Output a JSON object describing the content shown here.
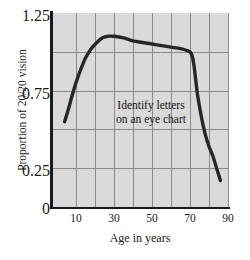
{
  "chart_data": {
    "type": "line",
    "title": "",
    "xlabel": "Age in years",
    "ylabel": "Proportion of 20/20 vision",
    "xlim": [
      3,
      90
    ],
    "ylim": [
      0,
      1.25
    ],
    "xticks": [
      10,
      30,
      50,
      70,
      90
    ],
    "xtick_labels": [
      "10",
      "30",
      "50",
      "70",
      "90"
    ],
    "yticks": [
      0,
      0.25,
      0.75,
      1.25
    ],
    "ytick_labels": [
      "0",
      "0.25",
      "0.75",
      "1.25"
    ],
    "grid": "both",
    "grid_x": [
      10,
      20,
      30,
      40,
      50,
      60,
      70,
      80,
      90
    ],
    "grid_y": [
      0.25,
      0.5,
      0.75,
      1.0
    ],
    "legend": "none",
    "annotations": [
      {
        "text_line_1": "Identify letters",
        "text_line_2": "on an eye chart",
        "x": 47,
        "y": 0.68
      }
    ],
    "series": [
      {
        "name": "Proportion of 20/20 vision",
        "color": "#262626",
        "x": [
          4,
          6,
          8,
          10,
          12,
          15,
          18,
          21,
          24,
          27,
          30,
          35,
          40,
          45,
          50,
          55,
          60,
          65,
          68,
          70,
          71,
          72,
          73,
          74,
          76,
          78,
          80,
          82,
          84,
          86
        ],
        "y": [
          0.55,
          0.63,
          0.72,
          0.8,
          0.87,
          0.96,
          1.02,
          1.06,
          1.09,
          1.1,
          1.1,
          1.09,
          1.07,
          1.06,
          1.05,
          1.04,
          1.03,
          1.02,
          1.01,
          1.0,
          0.98,
          0.92,
          0.82,
          0.72,
          0.58,
          0.47,
          0.39,
          0.33,
          0.25,
          0.17
        ]
      }
    ]
  },
  "axis": {
    "y_tick_0": "0",
    "y_tick_025": "0.25",
    "y_tick_075": "0.75",
    "y_tick_125": "1.25",
    "x_tick_10": "10",
    "x_tick_30": "30",
    "x_tick_50": "50",
    "x_tick_70": "70",
    "x_tick_90": "90"
  },
  "labels": {
    "y_axis_title": "Proportion of 20/20 vision",
    "x_axis_title": "Age in years",
    "annotation_line_1": "Identify letters",
    "annotation_line_2": "on an eye chart"
  },
  "colors": {
    "plot_background": "#d9d9d9",
    "grid_line": "#8a8a8a",
    "axis_line": "#1a1a1a",
    "curve": "#262626",
    "page_background": "#ffffff"
  }
}
